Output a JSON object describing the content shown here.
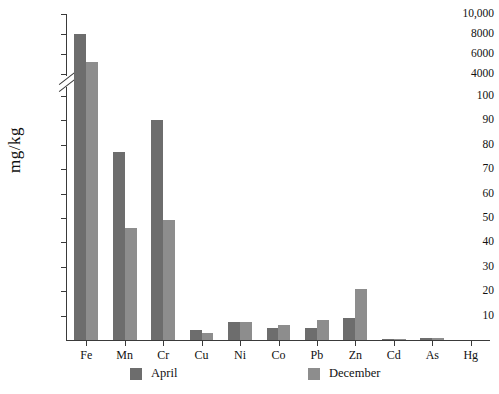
{
  "chart_data": {
    "type": "bar",
    "title": "",
    "xlabel": "",
    "ylabel": "mg/kg",
    "categories": [
      "Fe",
      "Mn",
      "Cr",
      "Cu",
      "Ni",
      "Co",
      "Pb",
      "Zn",
      "Cd",
      "As",
      "Hg"
    ],
    "series": [
      {
        "name": "April",
        "color": "#6d6d6d",
        "values": [
          8000,
          77,
          90,
          4,
          7.5,
          5,
          5,
          9,
          0.5,
          1,
          0
        ]
      },
      {
        "name": "December",
        "color": "#8d8d8d",
        "values": [
          5200,
          46,
          49,
          3,
          7.5,
          6,
          8,
          21,
          0.5,
          1,
          0
        ]
      }
    ],
    "axis_break": {
      "present": true,
      "lower_max": 100,
      "upper_min": 4000
    },
    "y_ticks_lower": [
      "10",
      "20",
      "30",
      "40",
      "50",
      "60",
      "70",
      "80",
      "90",
      "100"
    ],
    "y_ticks_upper": [
      "4000",
      "6000",
      "8000",
      "10,000"
    ],
    "ylim_lower": [
      0,
      100
    ],
    "ylim_upper": [
      4000,
      10000
    ],
    "grid": false,
    "legend_position": "bottom"
  },
  "legend": {
    "items": [
      {
        "label": "April"
      },
      {
        "label": "December"
      }
    ]
  }
}
